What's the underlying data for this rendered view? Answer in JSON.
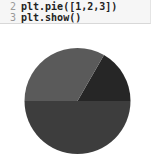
{
  "code_cell": {
    "lines": [
      {
        "number": "2",
        "text": "plt.pie([1,2,3])"
      },
      {
        "number": "3",
        "text": "plt.show()"
      }
    ]
  },
  "chart_data": {
    "type": "pie",
    "categories": [
      "1",
      "2",
      "3"
    ],
    "values": [
      1,
      2,
      3
    ],
    "title": "",
    "start_angle": 0,
    "direction": "counterclockwise",
    "colors": [
      "#262626",
      "#5a5a5a",
      "#3d3d3d"
    ],
    "labels_shown": false,
    "legend": false
  }
}
